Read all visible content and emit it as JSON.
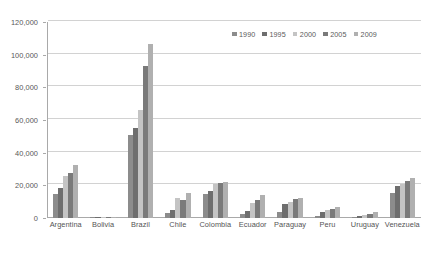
{
  "chart_data": {
    "type": "bar",
    "title": "",
    "subtitle": "",
    "xlabel": "",
    "ylabel": "",
    "ylim": [
      0,
      120000
    ],
    "ytick_labels": [
      "0",
      "20,000",
      "40,000",
      "60,000",
      "80,000",
      "100,000",
      "120,000"
    ],
    "ytick_values": [
      0,
      20000,
      40000,
      60000,
      80000,
      100000,
      120000
    ],
    "grid": true,
    "grid_axis": "y",
    "legend_position": "top-right",
    "orientation": "vertical",
    "grouping": "clustered",
    "categories": [
      "Argentina",
      "Bolivia",
      "Brazil",
      "Chile",
      "Colombia",
      "Ecuador",
      "Paraguay",
      "Peru",
      "Uruguay",
      "Venezuela"
    ],
    "series": [
      {
        "name": "1990",
        "color": "#8c8c8c",
        "values": [
          14500,
          400,
          51000,
          3000,
          14500,
          2500,
          3500,
          1500,
          700,
          15500
        ]
      },
      {
        "name": "1995",
        "color": "#6e6e6e",
        "values": [
          18500,
          500,
          55000,
          5000,
          16500,
          4500,
          8500,
          3500,
          1200,
          19500
        ]
      },
      {
        "name": "2000",
        "color": "#c4c4c4",
        "values": [
          26000,
          600,
          66000,
          12500,
          21000,
          9000,
          10000,
          5000,
          2000,
          21000
        ]
      },
      {
        "name": "2005",
        "color": "#7a7a7a",
        "values": [
          27500,
          800,
          93000,
          11000,
          21500,
          11000,
          11500,
          5500,
          2500,
          22500
        ]
      },
      {
        "name": "2009",
        "color": "#b0b0b0",
        "values": [
          32500,
          900,
          106500,
          15500,
          22000,
          14000,
          12000,
          6500,
          3500,
          24500
        ]
      }
    ]
  },
  "legend": {
    "entries": [
      {
        "label": "1990"
      },
      {
        "label": "1995"
      },
      {
        "label": "2000"
      },
      {
        "label": "2005"
      },
      {
        "label": "2009"
      }
    ]
  }
}
